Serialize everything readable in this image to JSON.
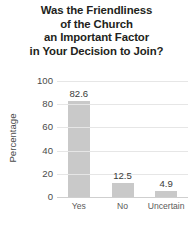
{
  "chart_data": {
    "type": "bar",
    "title": "Was the Friendliness of the Church an Important Factor in Your Decision to Join?",
    "title_lines": [
      "Was the Friendliness",
      "of the Church",
      "an Important Factor",
      "in Your Decision to Join?"
    ],
    "categories": [
      "Yes",
      "No",
      "Uncertain"
    ],
    "values": [
      82.6,
      12.5,
      4.9
    ],
    "value_labels": [
      "82.6",
      "12.5",
      "4.9"
    ],
    "xlabel": "",
    "ylabel": "Percentage",
    "ylim": [
      0,
      100
    ],
    "yticks": [
      0,
      20,
      40,
      60,
      80,
      100
    ],
    "ytick_labels": [
      "0",
      "20",
      "40",
      "60",
      "80",
      "100"
    ],
    "grid": true,
    "legend": false,
    "colors": {
      "bar": "#c9c9c9",
      "gridline": "#e6e6e6",
      "axis": "#cfcfcf",
      "title_text": "#231f20",
      "tick_text": "#4b4b4b",
      "category_text": "#5a5a5a",
      "value_text": "#3a3a3a",
      "background": "#ffffff"
    }
  }
}
